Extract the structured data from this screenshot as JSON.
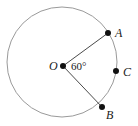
{
  "diagram": {
    "type": "circle-sector",
    "circle": {
      "cx": 62,
      "cy": 62,
      "r": 55,
      "stroke": "#9a9a9a"
    },
    "center_point": {
      "label": "O",
      "x": 63,
      "y": 66
    },
    "points": [
      {
        "label": "A",
        "x": 108,
        "y": 33
      },
      {
        "label": "C",
        "x": 116,
        "y": 71
      },
      {
        "label": "B",
        "x": 102,
        "y": 107
      }
    ],
    "radii": [
      {
        "from": "O",
        "to": "A"
      },
      {
        "from": "O",
        "to": "B"
      }
    ],
    "angle_label": "60°",
    "line_color": "#4a4a4a",
    "point_color": "#111111"
  },
  "labels": {
    "O": "O",
    "A": "A",
    "B": "B",
    "C": "C",
    "angle": "60°"
  }
}
